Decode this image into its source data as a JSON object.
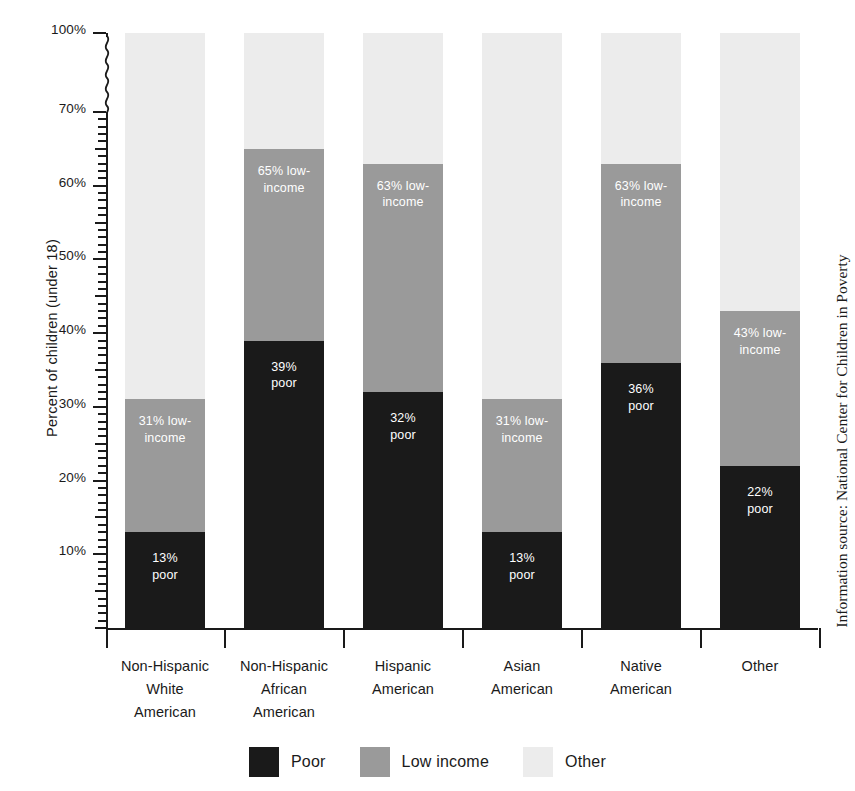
{
  "chart_data": {
    "type": "bar",
    "subtype": "stacked-bar-100",
    "title": "",
    "xlabel": "",
    "ylabel": "Percent of children (under 18)",
    "ylim": [
      0,
      100
    ],
    "y_axis_broken": true,
    "y_break_between": [
      70,
      100
    ],
    "grid": false,
    "legend_position": "bottom",
    "categories": [
      "Non-Hispanic\nWhite\nAmerican",
      "Non-Hispanic\nAfrican\nAmerican",
      "Hispanic\nAmerican",
      "Asian\nAmerican",
      "Native\nAmerican",
      "Other"
    ],
    "tick_labels": [
      "100%",
      "70%",
      "60%",
      "50%",
      "40%",
      "30%",
      "20%",
      "10%"
    ],
    "tick_values": [
      100,
      70,
      60,
      50,
      40,
      30,
      20,
      10
    ],
    "series": [
      {
        "name": "Poor",
        "color": "#1a1a1a",
        "values": [
          13,
          39,
          32,
          13,
          36,
          22
        ]
      },
      {
        "name": "Low income",
        "color": "#9a9a9a",
        "values": [
          18,
          26,
          31,
          18,
          27,
          21
        ],
        "cumulative_values": [
          31,
          65,
          63,
          31,
          63,
          43
        ]
      },
      {
        "name": "Other",
        "color": "#ececec",
        "values": [
          69,
          35,
          37,
          69,
          37,
          57
        ]
      }
    ],
    "bar_annotations": [
      {
        "poor": "13%\npoor",
        "low_income": "31% low-\nincome"
      },
      {
        "poor": "39%\npoor",
        "low_income": "65% low-\nincome"
      },
      {
        "poor": "32%\npoor",
        "low_income": "63% low-\nincome"
      },
      {
        "poor": "13%\npoor",
        "low_income": "31% low-\nincome"
      },
      {
        "poor": "36%\npoor",
        "low_income": "63% low-\nincome"
      },
      {
        "poor": "22%\npoor",
        "low_income": "43% low-\nincome"
      }
    ],
    "low_income_label_inside_gray": [
      true,
      true,
      true,
      true,
      false,
      true
    ]
  },
  "legend": {
    "items": [
      {
        "label": "Poor",
        "color": "#1a1a1a"
      },
      {
        "label": "Low income",
        "color": "#9a9a9a"
      },
      {
        "label": "Other",
        "color": "#ececec"
      }
    ]
  },
  "source_note": "Information source: National Center for Children in Poverty",
  "colors": {
    "poor": "#1a1a1a",
    "low_income": "#9a9a9a",
    "other": "#ececec",
    "axis": "#1a1a1a",
    "background": "#ffffff"
  }
}
